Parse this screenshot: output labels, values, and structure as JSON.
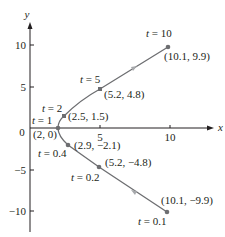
{
  "chart_data": {
    "type": "line",
    "title": "",
    "xlabel": "x",
    "ylabel": "y",
    "xlim": [
      0,
      11
    ],
    "ylim": [
      -11,
      11
    ],
    "grid": false,
    "x_ticks": [
      {
        "value": 5,
        "label": "5"
      },
      {
        "value": 10,
        "label": "10"
      }
    ],
    "y_ticks": [
      {
        "value": 10,
        "label": "10"
      },
      {
        "value": 5,
        "label": "5"
      },
      {
        "value": -5,
        "label": "−5"
      },
      {
        "value": -10,
        "label": "−10"
      }
    ],
    "origin_label": "0",
    "curve_color": "#6d6e71",
    "point_color": "#6d6e71",
    "points": [
      {
        "t": "t = 0.1",
        "coord": "(10.1, −9.9)",
        "x": 10.1,
        "y": -9.9
      },
      {
        "t": "t = 0.2",
        "coord": "(5.2, −4.8)",
        "x": 5.2,
        "y": -4.8
      },
      {
        "t": "t = 0.4",
        "coord": "(2.9, −2.1)",
        "x": 2.9,
        "y": -2.1
      },
      {
        "t": "t = 1",
        "coord": "(2, 0)",
        "x": 2,
        "y": 0
      },
      {
        "t": "t = 2",
        "coord": "(2.5, 1.5)",
        "x": 2.5,
        "y": 1.5
      },
      {
        "t": "t = 5",
        "coord": "(5.2, 4.8)",
        "x": 5.2,
        "y": 4.8
      },
      {
        "t": "t = 10",
        "coord": "(10.1, 9.9)",
        "x": 10.1,
        "y": 9.9
      }
    ]
  },
  "axes": {
    "x_label": "x",
    "y_label": "y",
    "origin": "0",
    "xt5": "5",
    "xt10": "10",
    "yt10": "10",
    "yt5": "5",
    "ytm5": "−5",
    "ytm10": "−10"
  },
  "labels": {
    "t01": "t = 0.1",
    "c01": "(10.1, −9.9)",
    "t02": "t = 0.2",
    "c02": "(5.2, −4.8)",
    "t04": "t = 0.4",
    "c04": "(2.9, −2.1)",
    "t1": "t = 1",
    "c1": "(2, 0)",
    "t2": "t = 2",
    "c2": "(2.5, 1.5)",
    "t5": "t = 5",
    "c5": "(5.2, 4.8)",
    "t10": "t = 10",
    "c10": "(10.1, 9.9)"
  }
}
